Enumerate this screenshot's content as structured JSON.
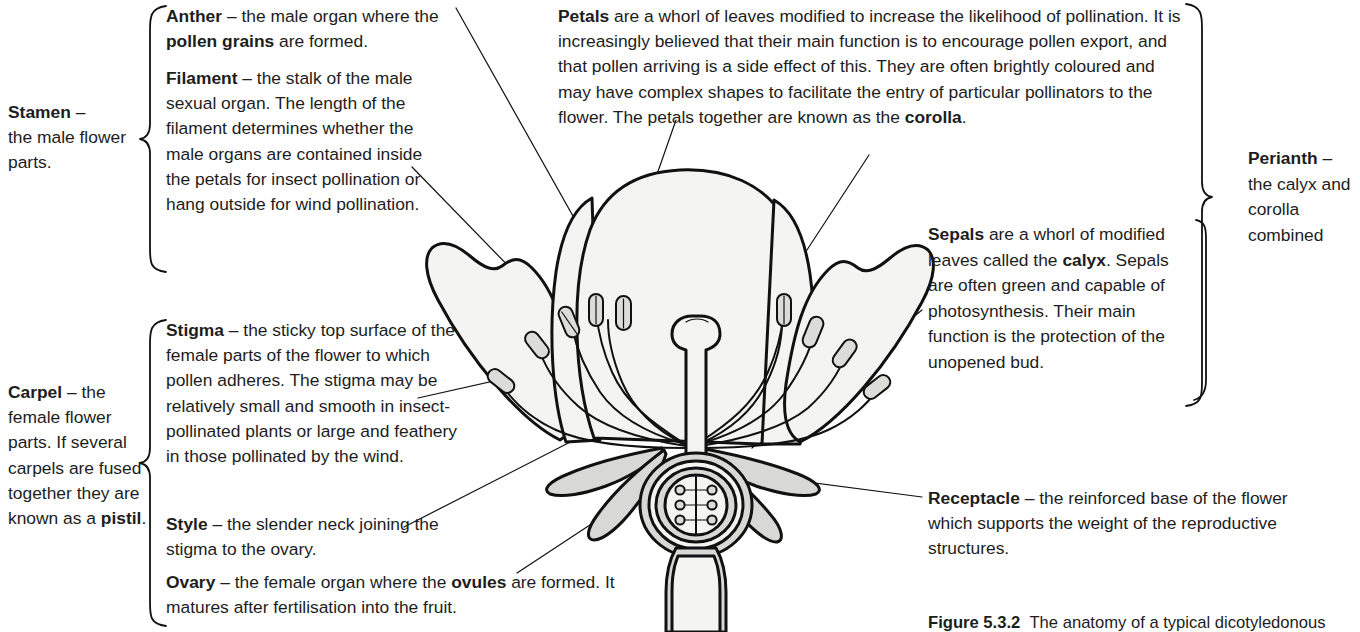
{
  "figure": {
    "number": "Figure 5.3.2",
    "caption": "The anatomy of a typical dicotyledonous"
  },
  "groups": {
    "stamen": {
      "term": "Stamen",
      "dash": " – ",
      "text": "the male flower parts."
    },
    "carpel": {
      "term": "Carpel",
      "dash": " – ",
      "text_a": "the female flower parts. If several carpels are fused together they are known as a ",
      "term_b": "pistil",
      "text_b": "."
    },
    "perianth": {
      "term": "Perianth",
      "dash": " – ",
      "text": "the calyx and corolla combined"
    }
  },
  "notes": {
    "anther": {
      "term": "Anther",
      "dash": " – ",
      "text_a": "the male organ where the ",
      "term_b": "pollen grains",
      "text_b": " are formed."
    },
    "filament": {
      "term": "Filament",
      "dash": " – ",
      "text": "the stalk of the male sexual organ. The length of the filament determines whether the male organs are contained inside the petals for insect pollination or hang outside for wind pollination."
    },
    "stigma": {
      "term": "Stigma",
      "dash": " – ",
      "text": "the sticky top surface of the female parts of the flower to which pollen adheres.  The stigma may be relatively small and smooth in insect-pollinated plants or large and feathery in those pollinated by the wind."
    },
    "style": {
      "term": "Style",
      "dash": " – ",
      "text": "the slender neck joining the stigma to the ovary."
    },
    "ovary": {
      "term": "Ovary",
      "dash": " – ",
      "text_a": "the female organ where the ",
      "term_b": "ovules",
      "text_b": " are formed.  It matures after fertilisation into the fruit."
    },
    "petals": {
      "term": "Petals",
      "text_a": " are a whorl of leaves modified to increase the likelihood of pollination.  It is increasingly believed that their main function is to encourage pollen export, and that pollen arriving is a side effect of this.  They are often brightly coloured and may have complex shapes to facilitate the entry of particular pollinators to the flower.  The petals together are known as the ",
      "term_b": "corolla",
      "text_b": "."
    },
    "sepals": {
      "term": "Sepals",
      "text_a": " are a whorl of modified leaves called the ",
      "term_b": "calyx",
      "text_b": ".  Sepals are often green and capable of photosynthesis. Their main function is the protection of the unopened bud."
    },
    "receptacle": {
      "term": "Receptacle",
      "dash": " – ",
      "text": "the reinforced base of the flower which supports the weight of the reproductive structures."
    }
  },
  "diagram": {
    "parts": [
      "petal-left-outer",
      "petal-left-inner",
      "petal-centre",
      "petal-right-inner",
      "petal-right-outer",
      "stamen-filament",
      "stamen-anther",
      "stigma",
      "style",
      "ovary",
      "ovule",
      "sepal",
      "receptacle",
      "pedicel"
    ]
  },
  "colors": {
    "ink": "#1a1a1a",
    "page": "#ffffff",
    "fill_light": "#f3f3f1",
    "fill_mid": "#d9d9d6",
    "fill_shade": "#c9c9c5"
  }
}
